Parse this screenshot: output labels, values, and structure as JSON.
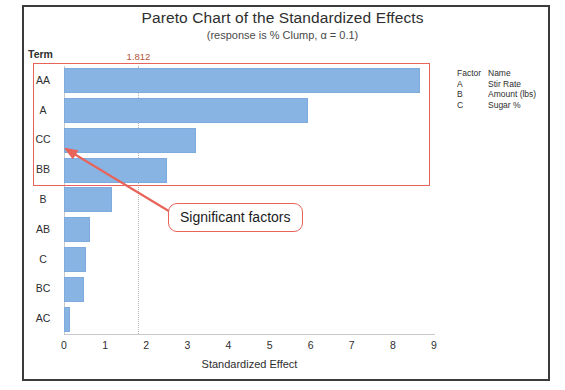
{
  "title": "Pareto Chart of the Standardized Effects",
  "subtitle": "(response is % Clump, α = 0.1)",
  "axis": {
    "term_header": "Term",
    "xaxis_title": "Standardized Effect"
  },
  "reference": {
    "label": "1.812",
    "value": 1.812
  },
  "annotation": {
    "callout_text": "Significant factors",
    "box_color": "#e8645a"
  },
  "legend": {
    "header_factor": "Factor",
    "header_name": "Name",
    "rows": [
      {
        "factor": "A",
        "name": "Stir Rate"
      },
      {
        "factor": "B",
        "name": "Amount (lbs)"
      },
      {
        "factor": "C",
        "name": "Sugar %"
      }
    ]
  },
  "colors": {
    "bar_fill": "#87b4e3",
    "bar_edge": "#7faadd",
    "annotation_red": "#e8645a",
    "ref_label": "#b4563c",
    "frame": "#3b3b3b"
  },
  "chart_data": {
    "type": "bar",
    "orientation": "horizontal",
    "title": "Pareto Chart of the Standardized Effects",
    "subtitle": "(response is % Clump, α = 0.1)",
    "xlabel": "Standardized Effect",
    "ylabel": "Term",
    "xlim": [
      0,
      9
    ],
    "xticks": [
      0,
      1,
      2,
      3,
      4,
      5,
      6,
      7,
      8,
      9
    ],
    "grid": false,
    "legend_position": "right",
    "reference_line": {
      "value": 1.812,
      "label": "1.812",
      "orientation": "vertical",
      "style": "dotted"
    },
    "categories": [
      "AA",
      "A",
      "CC",
      "BB",
      "B",
      "AB",
      "C",
      "BC",
      "AC"
    ],
    "values": [
      8.66,
      5.94,
      3.21,
      2.5,
      1.17,
      0.63,
      0.53,
      0.48,
      0.15
    ],
    "significant": [
      "AA",
      "A",
      "CC",
      "BB"
    ],
    "annotations": [
      {
        "text": "Significant factors",
        "points_to": "CC",
        "type": "callout-arrow"
      }
    ]
  }
}
